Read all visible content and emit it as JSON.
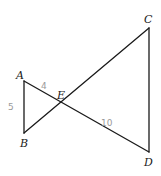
{
  "diagram": {
    "vertices": {
      "A": {
        "label": "A",
        "x": 24,
        "y": 81,
        "lx": 16,
        "ly": 79
      },
      "B": {
        "label": "B",
        "x": 24,
        "y": 133,
        "lx": 20,
        "ly": 147
      },
      "C": {
        "label": "C",
        "x": 149,
        "y": 28,
        "lx": 144,
        "ly": 23
      },
      "D": {
        "label": "D",
        "x": 149,
        "y": 152,
        "lx": 144,
        "ly": 166
      },
      "E": {
        "label": "E",
        "x": 62,
        "y": 103,
        "lx": 57,
        "ly": 99
      }
    },
    "segments": [
      {
        "name": "segment-ab",
        "from": "A",
        "to": "B"
      },
      {
        "name": "segment-ad",
        "from": "A",
        "to": "D"
      },
      {
        "name": "segment-bc",
        "from": "B",
        "to": "C"
      },
      {
        "name": "segment-cd",
        "from": "C",
        "to": "D"
      }
    ],
    "annotations": {
      "ae_length": {
        "text": "4",
        "x": 41,
        "y": 89
      },
      "ab_length": {
        "text": "5",
        "x": 8,
        "y": 110
      },
      "ed_length": {
        "text": "10",
        "x": 101,
        "y": 126
      }
    }
  }
}
